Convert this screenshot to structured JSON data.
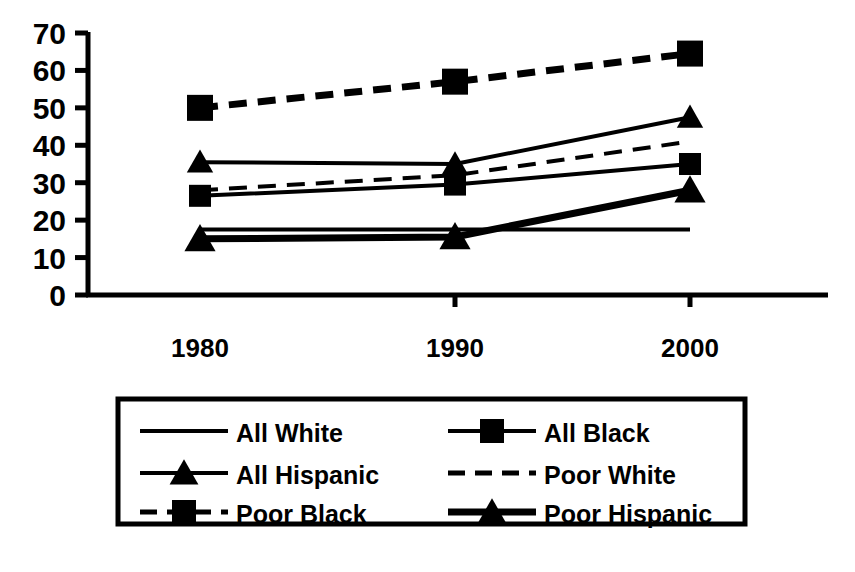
{
  "chart_data": {
    "type": "line",
    "title": "",
    "subtitle": "",
    "xlabel": "",
    "ylabel": "",
    "categories": [
      "1980",
      "1990",
      "2000"
    ],
    "x": [
      1980,
      1990,
      2000
    ],
    "ylim": [
      0,
      70
    ],
    "ytick_values": [
      0,
      10,
      20,
      30,
      40,
      50,
      60,
      70
    ],
    "ytick_labels": [
      "0",
      "10",
      "20",
      "30",
      "40",
      "50",
      "60",
      "70"
    ],
    "xtick_labels": [
      "1980",
      "1990",
      "2000"
    ],
    "grid": false,
    "legend_position": "bottom",
    "legend_columns": 2,
    "color": "#000000",
    "series": [
      {
        "name": "All White",
        "values": [
          17.5,
          17.5,
          17.5
        ],
        "marker": "none",
        "dash": "solid",
        "width": "thin"
      },
      {
        "name": "All Black",
        "values": [
          26.5,
          29.5,
          35
        ],
        "marker": "square",
        "dash": "solid",
        "width": "thin"
      },
      {
        "name": "All Hispanic",
        "values": [
          35.5,
          35,
          47.5
        ],
        "marker": "triangle",
        "dash": "solid",
        "width": "thin"
      },
      {
        "name": "Poor White",
        "values": [
          28,
          32,
          41
        ],
        "marker": "none",
        "dash": "dashed",
        "width": "thin"
      },
      {
        "name": "Poor Black",
        "values": [
          50,
          57,
          64.5
        ],
        "marker": "square",
        "dash": "dashed",
        "width": "thick"
      },
      {
        "name": "Poor Hispanic",
        "values": [
          15,
          15.5,
          28
        ],
        "marker": "triangle",
        "dash": "solid",
        "width": "thick"
      }
    ]
  },
  "legend": {
    "items": [
      {
        "label": "All White"
      },
      {
        "label": "All Black"
      },
      {
        "label": "All Hispanic"
      },
      {
        "label": "Poor White"
      },
      {
        "label": "Poor  Black"
      },
      {
        "label": "Poor  Hispanic"
      }
    ]
  },
  "axis": {
    "y_labels": [
      "70",
      "60",
      "50",
      "40",
      "30",
      "20",
      "10",
      "0"
    ],
    "x_labels": [
      "1980",
      "1990",
      "2000"
    ]
  }
}
